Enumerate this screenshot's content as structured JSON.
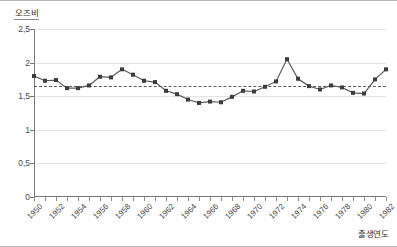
{
  "chart_data": {
    "type": "line",
    "title": "",
    "subtitle": "",
    "ylabel": "오즈비",
    "xlabel": "출생연도",
    "xlim": [
      1950,
      1982
    ],
    "ylim": [
      0,
      2.5
    ],
    "grid": true,
    "legend": null,
    "y_ticks": [
      "0",
      "0,5",
      "1",
      "1,5",
      "2",
      "2,5"
    ],
    "y_tick_values": [
      0,
      0.5,
      1,
      1.5,
      2,
      2.5
    ],
    "x_ticks": [
      "1950",
      "1952",
      "1954",
      "1956",
      "1958",
      "1960",
      "1962",
      "1964",
      "1966",
      "1968",
      "1970",
      "1972",
      "1974",
      "1976",
      "1978",
      "1980",
      "1982"
    ],
    "x_tick_values": [
      1950,
      1952,
      1954,
      1956,
      1958,
      1960,
      1962,
      1964,
      1966,
      1968,
      1970,
      1972,
      1974,
      1976,
      1978,
      1980,
      1982
    ],
    "x": [
      1950,
      1951,
      1952,
      1953,
      1954,
      1955,
      1956,
      1957,
      1958,
      1959,
      1960,
      1961,
      1962,
      1963,
      1964,
      1965,
      1966,
      1967,
      1968,
      1969,
      1970,
      1971,
      1972,
      1973,
      1974,
      1975,
      1976,
      1977,
      1978,
      1979,
      1980,
      1981,
      1982
    ],
    "values": [
      1.8,
      1.73,
      1.74,
      1.62,
      1.62,
      1.66,
      1.79,
      1.78,
      1.9,
      1.82,
      1.73,
      1.71,
      1.58,
      1.53,
      1.45,
      1.4,
      1.42,
      1.41,
      1.49,
      1.58,
      1.57,
      1.64,
      1.72,
      2.05,
      1.76,
      1.65,
      1.6,
      1.66,
      1.63,
      1.55,
      1.54,
      1.75,
      1.9
    ],
    "reference_line": {
      "value": 1.65,
      "style": "dashed"
    },
    "series_style": {
      "line_color": "#595959",
      "marker": "square",
      "marker_color": "#3c3c3c",
      "marker_size": 4
    }
  }
}
